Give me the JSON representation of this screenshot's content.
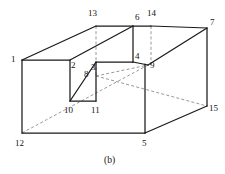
{
  "figure": {
    "caption": "(b)",
    "caption_pos": {
      "x": 104,
      "y": 156
    },
    "stroke_solid": "#1a1a1a",
    "stroke_dashed": "#8c8c8c",
    "background": "#ffffff",
    "width": 225,
    "height": 174
  },
  "vertices": [
    {
      "id": "1",
      "label": "1",
      "point": {
        "x": 22,
        "y": 60
      },
      "label_pos": {
        "x": 11,
        "y": 55
      },
      "style": "solid"
    },
    {
      "id": "2",
      "label": "2",
      "point": {
        "x": 70,
        "y": 60
      },
      "label_pos": {
        "x": 71,
        "y": 61
      },
      "style": "solid"
    },
    {
      "id": "3",
      "label": "3",
      "point": {
        "x": 96,
        "y": 62
      },
      "label_pos": {
        "x": 91,
        "y": 63
      },
      "style": "solid"
    },
    {
      "id": "4",
      "label": "4",
      "point": {
        "x": 133,
        "y": 62
      },
      "label_pos": {
        "x": 135,
        "y": 52
      },
      "style": "solid"
    },
    {
      "id": "5",
      "label": "5",
      "point": {
        "x": 145,
        "y": 133
      },
      "label_pos": {
        "x": 142,
        "y": 139
      },
      "style": "solid"
    },
    {
      "id": "6",
      "label": "6",
      "point": {
        "x": 133,
        "y": 26
      },
      "label_pos": {
        "x": 135,
        "y": 13
      },
      "style": "solid"
    },
    {
      "id": "7",
      "label": "7",
      "point": {
        "x": 207,
        "y": 28
      },
      "label_pos": {
        "x": 210,
        "y": 18
      },
      "style": "solid"
    },
    {
      "id": "8",
      "label": "8",
      "point": {
        "x": 96,
        "y": 76
      },
      "label_pos": {
        "x": 84,
        "y": 70
      },
      "style": "hidden"
    },
    {
      "id": "9",
      "label": "9",
      "point": {
        "x": 148,
        "y": 65
      },
      "label_pos": {
        "x": 150,
        "y": 61
      },
      "style": "solid"
    },
    {
      "id": "10",
      "label": "10",
      "point": {
        "x": 70,
        "y": 101
      },
      "label_pos": {
        "x": 64,
        "y": 106
      },
      "style": "solid"
    },
    {
      "id": "11",
      "label": "11",
      "point": {
        "x": 96,
        "y": 101
      },
      "label_pos": {
        "x": 91,
        "y": 106
      },
      "style": "solid"
    },
    {
      "id": "12",
      "label": "12",
      "point": {
        "x": 22,
        "y": 133
      },
      "label_pos": {
        "x": 15,
        "y": 139
      },
      "style": "solid"
    },
    {
      "id": "13",
      "label": "13",
      "point": {
        "x": 96,
        "y": 26
      },
      "label_pos": {
        "x": 88,
        "y": 9
      },
      "style": "hidden"
    },
    {
      "id": "14",
      "label": "14",
      "point": {
        "x": 151,
        "y": 26
      },
      "label_pos": {
        "x": 147,
        "y": 9
      },
      "style": "hidden"
    },
    {
      "id": "15",
      "label": "15",
      "point": {
        "x": 207,
        "y": 106
      },
      "label_pos": {
        "x": 209,
        "y": 104
      },
      "style": "solid"
    }
  ],
  "edges_solid": [
    {
      "name": "edge-1-2",
      "from": [
        22,
        60
      ],
      "to": [
        70,
        60
      ]
    },
    {
      "name": "edge-1-12",
      "from": [
        22,
        60
      ],
      "to": [
        22,
        133
      ]
    },
    {
      "name": "edge-12-5",
      "from": [
        22,
        133
      ],
      "to": [
        145,
        133
      ]
    },
    {
      "name": "edge-5-4",
      "from": [
        145,
        133
      ],
      "to": [
        145,
        64
      ]
    },
    {
      "name": "edge-1-13",
      "from": [
        22,
        60
      ],
      "to": [
        96,
        26
      ]
    },
    {
      "name": "edge-13-6",
      "from": [
        96,
        26
      ],
      "to": [
        133,
        26
      ]
    },
    {
      "name": "edge-2-6",
      "from": [
        70,
        60
      ],
      "to": [
        133,
        26
      ]
    },
    {
      "name": "edge-2-10",
      "from": [
        70,
        60
      ],
      "to": [
        70,
        101
      ]
    },
    {
      "name": "edge-10-11",
      "from": [
        70,
        101
      ],
      "to": [
        96,
        101
      ]
    },
    {
      "name": "edge-11-3",
      "from": [
        96,
        101
      ],
      "to": [
        96,
        62
      ]
    },
    {
      "name": "edge-10-3",
      "from": [
        70,
        101
      ],
      "to": [
        96,
        62
      ]
    },
    {
      "name": "edge-3-4",
      "from": [
        96,
        62
      ],
      "to": [
        133,
        62
      ]
    },
    {
      "name": "edge-6-4",
      "from": [
        133,
        26
      ],
      "to": [
        133,
        62
      ]
    },
    {
      "name": "edge-6-14",
      "from": [
        133,
        26
      ],
      "to": [
        151,
        26
      ]
    },
    {
      "name": "edge-14-7",
      "from": [
        151,
        26
      ],
      "to": [
        207,
        28
      ]
    },
    {
      "name": "edge-9-7",
      "from": [
        148,
        65
      ],
      "to": [
        207,
        28
      ]
    },
    {
      "name": "edge-4-9",
      "from": [
        133,
        62
      ],
      "to": [
        148,
        65
      ]
    },
    {
      "name": "edge-7-15",
      "from": [
        207,
        28
      ],
      "to": [
        207,
        106
      ]
    },
    {
      "name": "edge-5-15",
      "from": [
        145,
        133
      ],
      "to": [
        207,
        106
      ]
    }
  ],
  "edges_dashed": [
    {
      "name": "hidden-13-3",
      "from": [
        96,
        26
      ],
      "to": [
        96,
        62
      ]
    },
    {
      "name": "hidden-14-9",
      "from": [
        151,
        26
      ],
      "to": [
        151,
        65
      ]
    },
    {
      "name": "hidden-12-9",
      "from": [
        22,
        133
      ],
      "to": [
        148,
        65
      ]
    },
    {
      "name": "hidden-8-9",
      "from": [
        96,
        76
      ],
      "to": [
        148,
        65
      ]
    },
    {
      "name": "hidden-8-15",
      "from": [
        96,
        76
      ],
      "to": [
        207,
        106
      ]
    },
    {
      "name": "hidden-3-8",
      "from": [
        96,
        62
      ],
      "to": [
        96,
        76
      ]
    }
  ]
}
